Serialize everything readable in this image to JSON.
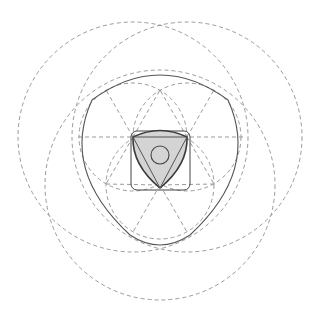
{
  "diagram": {
    "title": "",
    "colors": {
      "construction_line": "#9a9a9a",
      "outline": "#555555",
      "rotor_fill": "#d4d4d4",
      "background": "#ffffff"
    },
    "center": [
      160,
      158
    ],
    "large_circles": [
      {
        "cx": 133,
        "cy": 137,
        "r": 115
      },
      {
        "cx": 187,
        "cy": 137,
        "r": 115
      },
      {
        "cx": 160,
        "cy": 185,
        "r": 115
      }
    ],
    "medium_circles": [
      {
        "cx": 133,
        "cy": 137,
        "r": 54
      },
      {
        "cx": 187,
        "cy": 137,
        "r": 54
      },
      {
        "cx": 160,
        "cy": 185,
        "r": 54
      },
      {
        "cx": 160,
        "cy": 105,
        "r": 54
      },
      {
        "cx": 110,
        "cy": 185,
        "r": 54
      },
      {
        "cx": 210,
        "cy": 185,
        "r": 54
      }
    ],
    "inner_triangle": [
      [
        133,
        137
      ],
      [
        187,
        137
      ],
      [
        160,
        185
      ]
    ],
    "hub_circle": {
      "cx": 160,
      "cy": 155,
      "r": 9
    },
    "bounding_square": {
      "x": 131,
      "y": 131,
      "w": 59,
      "h": 59,
      "rx": 6
    }
  }
}
